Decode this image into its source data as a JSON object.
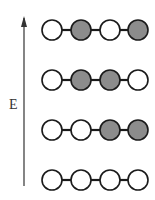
{
  "axis": {
    "label": "E",
    "direction": "up",
    "color": "#333333"
  },
  "colors": {
    "filled": "#8c8c8c",
    "empty": "#ffffff",
    "outline": "#1a1a1a",
    "bond": "#1a1a1a"
  },
  "rows": [
    {
      "name": "level-4",
      "states": [
        0,
        1,
        0,
        1
      ]
    },
    {
      "name": "level-3",
      "states": [
        0,
        1,
        1,
        0
      ]
    },
    {
      "name": "level-2",
      "states": [
        0,
        0,
        1,
        1
      ]
    },
    {
      "name": "level-1",
      "states": [
        0,
        0,
        0,
        0
      ]
    }
  ]
}
